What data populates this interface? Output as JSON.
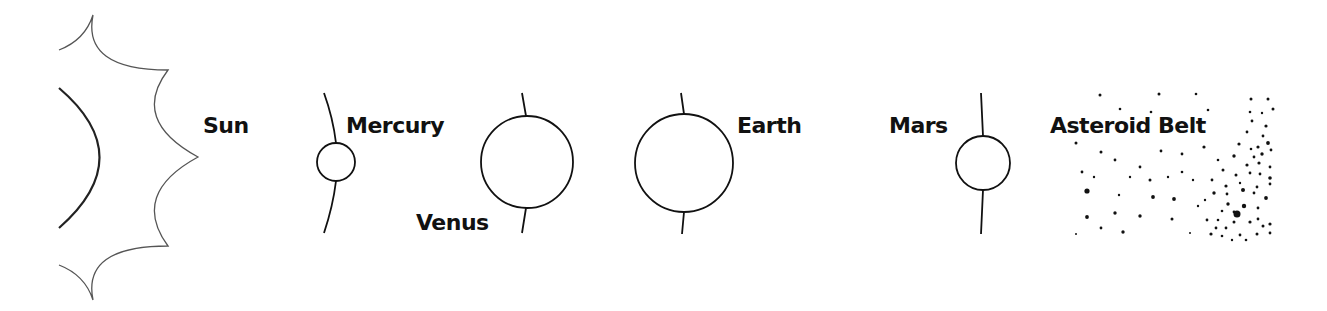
{
  "diagram": {
    "colors": {
      "stroke": "#111111",
      "corona": "#555555",
      "background": "#ffffff"
    },
    "bodies": [
      {
        "name": "Sun",
        "label": "Sun"
      },
      {
        "name": "Mercury",
        "label": "Mercury"
      },
      {
        "name": "Venus",
        "label": "Venus"
      },
      {
        "name": "Earth",
        "label": "Earth"
      },
      {
        "name": "Mars",
        "label": "Mars"
      },
      {
        "name": "Asteroid Belt",
        "label": "Asteroid Belt"
      }
    ],
    "planets": [
      {
        "id": "mercury",
        "cx": 336,
        "cy": 162,
        "r": 19,
        "orbit_top": [
          [
            324,
            93
          ],
          [
            332,
            120
          ],
          [
            336,
            143
          ]
        ],
        "orbit_bottom": [
          [
            336,
            181
          ],
          [
            332,
            208
          ],
          [
            324,
            233
          ]
        ],
        "label_x": 346,
        "label_y": 133
      },
      {
        "id": "venus",
        "cx": 527,
        "cy": 162,
        "r": 46,
        "orbit_top": [
          [
            522,
            93
          ],
          [
            524,
            105
          ],
          [
            526,
            116
          ]
        ],
        "orbit_bottom": [
          [
            526,
            208
          ],
          [
            524,
            220
          ],
          [
            522,
            233
          ]
        ],
        "label_x": 416,
        "label_y": 230
      },
      {
        "id": "earth",
        "cx": 684,
        "cy": 163,
        "r": 49,
        "orbit_top": [
          [
            681,
            93
          ],
          [
            683,
            104
          ],
          [
            684,
            114
          ]
        ],
        "orbit_bottom": [
          [
            684,
            212
          ],
          [
            683,
            223
          ],
          [
            682,
            234
          ]
        ],
        "label_x": 737,
        "label_y": 133
      },
      {
        "id": "mars",
        "cx": 983,
        "cy": 163,
        "r": 27,
        "orbit_top": [
          [
            981,
            93
          ],
          [
            982,
            115
          ],
          [
            983,
            136
          ]
        ],
        "orbit_bottom": [
          [
            983,
            190
          ],
          [
            982,
            212
          ],
          [
            981,
            234
          ]
        ],
        "label_x": 889,
        "label_y": 133
      }
    ],
    "sun": {
      "label_x": 203,
      "label_y": 133
    },
    "asteroid_label": {
      "x": 1050,
      "y": 133
    },
    "asteroids": [
      [
        1100,
        95,
        1.5
      ],
      [
        1159,
        94,
        1.5
      ],
      [
        1196,
        94,
        1.3
      ],
      [
        1120,
        109,
        1.3
      ],
      [
        1151,
        112,
        1.3
      ],
      [
        1208,
        110,
        1.3
      ],
      [
        1076,
        143,
        1.5
      ],
      [
        1101,
        152,
        1.5
      ],
      [
        1161,
        151,
        1.4
      ],
      [
        1182,
        154,
        1.4
      ],
      [
        1204,
        147,
        1.6
      ],
      [
        1115,
        160,
        1.4
      ],
      [
        1140,
        167,
        1.4
      ],
      [
        1082,
        172,
        1.4
      ],
      [
        1094,
        177,
        1.2
      ],
      [
        1130,
        177,
        1.2
      ],
      [
        1150,
        180,
        1.5
      ],
      [
        1168,
        177,
        1.2
      ],
      [
        1182,
        172,
        1.3
      ],
      [
        1087,
        191,
        2.6
      ],
      [
        1119,
        195,
        1.2
      ],
      [
        1153,
        197,
        1.9
      ],
      [
        1174,
        199,
        1.9
      ],
      [
        1198,
        206,
        1.2
      ],
      [
        1087,
        217,
        1.9
      ],
      [
        1115,
        213,
        1.7
      ],
      [
        1140,
        216,
        1.7
      ],
      [
        1172,
        219,
        1.5
      ],
      [
        1101,
        228,
        1.4
      ],
      [
        1123,
        232,
        1.7
      ],
      [
        1076,
        234,
        1.0
      ],
      [
        1190,
        233,
        1.0
      ],
      [
        1251,
        99,
        1.5
      ],
      [
        1268,
        99,
        1.5
      ],
      [
        1250,
        112,
        1.3
      ],
      [
        1262,
        113,
        1.2
      ],
      [
        1273,
        109,
        1.5
      ],
      [
        1252,
        121,
        1.4
      ],
      [
        1266,
        126,
        1.6
      ],
      [
        1247,
        132,
        1.4
      ],
      [
        1263,
        136,
        1.4
      ],
      [
        1239,
        144,
        1.6
      ],
      [
        1251,
        149,
        1.3
      ],
      [
        1258,
        147,
        1.6
      ],
      [
        1268,
        143,
        1.9
      ],
      [
        1234,
        156,
        1.7
      ],
      [
        1254,
        157,
        1.4
      ],
      [
        1262,
        154,
        1.7
      ],
      [
        1271,
        150,
        1.4
      ],
      [
        1247,
        165,
        1.6
      ],
      [
        1259,
        163,
        1.6
      ],
      [
        1270,
        167,
        1.4
      ],
      [
        1223,
        170,
        1.5
      ],
      [
        1236,
        175,
        1.5
      ],
      [
        1250,
        173,
        1.4
      ],
      [
        1260,
        174,
        1.4
      ],
      [
        1270,
        178,
        1.8
      ],
      [
        1212,
        180,
        1.4
      ],
      [
        1226,
        186,
        1.6
      ],
      [
        1240,
        183,
        1.2
      ],
      [
        1257,
        187,
        1.4
      ],
      [
        1270,
        184,
        1.4
      ],
      [
        1214,
        193,
        1.7
      ],
      [
        1227,
        194,
        1.4
      ],
      [
        1243,
        190,
        2.0
      ],
      [
        1254,
        193,
        1.4
      ],
      [
        1266,
        198,
        1.9
      ],
      [
        1228,
        204,
        1.7
      ],
      [
        1244,
        206,
        2.2
      ],
      [
        1258,
        208,
        1.4
      ],
      [
        1222,
        211,
        1.3
      ],
      [
        1234,
        212,
        1.4
      ],
      [
        1207,
        220,
        1.4
      ],
      [
        1218,
        220,
        1.3
      ],
      [
        1234,
        222,
        1.5
      ],
      [
        1258,
        219,
        1.4
      ],
      [
        1270,
        224,
        1.6
      ],
      [
        1216,
        228,
        1.4
      ],
      [
        1226,
        228,
        1.4
      ],
      [
        1237,
        214,
        3.5
      ],
      [
        1250,
        222,
        1.6
      ],
      [
        1263,
        226,
        1.5
      ],
      [
        1211,
        234,
        1.6
      ],
      [
        1222,
        236,
        1.3
      ],
      [
        1240,
        235,
        1.4
      ],
      [
        1257,
        234,
        1.5
      ],
      [
        1270,
        233,
        1.4
      ],
      [
        1205,
        200,
        1.2
      ],
      [
        1193,
        180,
        1.2
      ],
      [
        1218,
        160,
        1.3
      ],
      [
        1246,
        240,
        1.3
      ],
      [
        1232,
        240,
        1.2
      ]
    ]
  }
}
